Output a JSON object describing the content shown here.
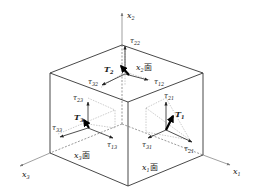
{
  "diagram": {
    "type": "stress-cube",
    "axes": [
      {
        "id": "x1",
        "label": "x",
        "sub": "1"
      },
      {
        "id": "x2",
        "label": "x",
        "sub": "2"
      },
      {
        "id": "x3",
        "label": "x",
        "sub": "3"
      }
    ],
    "faces": [
      {
        "id": "x1face",
        "label": "x",
        "sub": "1",
        "suffix": "面"
      },
      {
        "id": "x2face",
        "label": "x",
        "sub": "2",
        "suffix": "面"
      },
      {
        "id": "x3face",
        "label": "x",
        "sub": "3",
        "suffix": "面"
      }
    ],
    "tractions": [
      {
        "id": "T1",
        "label": "T",
        "sub": "1"
      },
      {
        "id": "T2",
        "label": "T",
        "sub": "2"
      },
      {
        "id": "T3",
        "label": "T",
        "sub": "3"
      }
    ],
    "stresses": {
      "x2face": [
        {
          "label": "τ",
          "sub": "22"
        },
        {
          "label": "τ",
          "sub": "32"
        },
        {
          "label": "τ",
          "sub": "12"
        }
      ],
      "x3face": [
        {
          "label": "τ",
          "sub": "23"
        },
        {
          "label": "τ",
          "sub": "33"
        },
        {
          "label": "τ",
          "sub": "13"
        }
      ],
      "x1face": [
        {
          "label": "τ",
          "sub": "21"
        },
        {
          "label": "τ",
          "sub": "31"
        },
        {
          "label": "τ",
          "sub": "21"
        }
      ]
    }
  }
}
